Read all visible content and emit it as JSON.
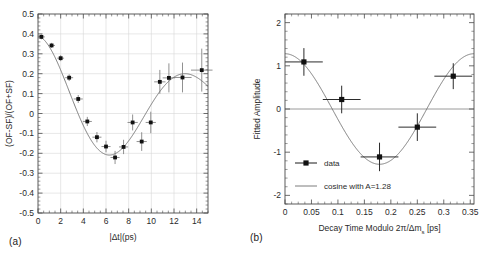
{
  "figure": {
    "panel_a_tag": "(a)",
    "panel_b_tag": "(b)"
  },
  "chart_data": [
    {
      "id": "panel-a",
      "type": "scatter",
      "title": "",
      "xlabel": "|Δt|(ps)",
      "ylabel": "(OF-SF)/(OF+SF)",
      "xlim": [
        0,
        15
      ],
      "ylim": [
        -0.5,
        0.5
      ],
      "grid": true,
      "xticks": [
        0,
        2,
        4,
        6,
        8,
        10,
        12,
        14
      ],
      "xtick_labels": [
        "0",
        "2",
        "4",
        "6",
        "8",
        "10",
        "12",
        "14"
      ],
      "yticks": [
        -0.5,
        -0.4,
        -0.3,
        -0.2,
        -0.1,
        0,
        0.1,
        0.2,
        0.3,
        0.4,
        0.5
      ],
      "ytick_labels": [
        "-0.5",
        "-0.4",
        "-0.3",
        "-0.2",
        "-0.1",
        "0",
        "0.1",
        "0.2",
        "0.3",
        "0.4",
        "0.5"
      ],
      "series": [
        {
          "name": "data",
          "marker": "filled-square",
          "x": [
            0.3,
            1.2,
            2.0,
            2.75,
            3.55,
            4.35,
            5.2,
            6.0,
            6.8,
            7.55,
            8.35,
            9.15,
            9.95,
            10.75,
            11.55,
            12.75,
            14.45
          ],
          "y": [
            0.385,
            0.342,
            0.278,
            0.18,
            0.073,
            -0.04,
            -0.119,
            -0.166,
            -0.221,
            -0.168,
            -0.045,
            -0.141,
            -0.045,
            0.159,
            0.179,
            0.181,
            0.218
          ],
          "xerr": [
            0.3,
            0.3,
            0.3,
            0.35,
            0.4,
            0.4,
            0.4,
            0.4,
            0.4,
            0.4,
            0.45,
            0.45,
            0.45,
            0.5,
            0.55,
            0.8,
            0.95
          ],
          "yerr": [
            0.012,
            0.013,
            0.015,
            0.017,
            0.02,
            0.023,
            0.026,
            0.029,
            0.033,
            0.036,
            0.04,
            0.047,
            0.054,
            0.06,
            0.073,
            0.075,
            0.108
          ]
        }
      ],
      "fit": {
        "name": "fit-curve",
        "description": "damped oscillation fit"
      }
    },
    {
      "id": "panel-b",
      "type": "scatter",
      "title": "",
      "xlabel": "Decay Time Modulo 2π/Δm",
      "xlabel_sub": "s",
      "xlabel_unit": " [ps]",
      "ylabel": "Fitted Amplitude",
      "xlim": [
        0,
        0.3571
      ],
      "ylim": [
        -2.2,
        2.2
      ],
      "grid": false,
      "xticks": [
        0,
        0.05,
        0.1,
        0.15,
        0.2,
        0.25,
        0.3,
        0.35
      ],
      "xtick_labels": [
        "0",
        "0.05",
        "0.1",
        "0.15",
        "0.2",
        "0.25",
        "0.3",
        "0.35"
      ],
      "yticks": [
        -2,
        -1,
        0,
        1,
        2
      ],
      "ytick_labels": [
        "-2",
        "-1",
        "0",
        "1",
        "2"
      ],
      "zero_line": 0,
      "series": [
        {
          "name": "data",
          "marker": "filled-square",
          "x": [
            0.0357,
            0.1071,
            0.1786,
            0.25,
            0.3179
          ],
          "y": [
            1.09,
            0.22,
            -1.11,
            -0.42,
            0.76
          ],
          "xerr": [
            0.0357,
            0.0357,
            0.0357,
            0.0357,
            0.0357
          ],
          "yerr": [
            0.32,
            0.32,
            0.33,
            0.32,
            0.3
          ]
        }
      ],
      "fit": {
        "name": "cosine-fit",
        "amplitude": 1.28,
        "period": 0.3571,
        "label": "cosine with A=1.28"
      },
      "legend": {
        "position": "lower-left",
        "entries": [
          {
            "label": "data",
            "marker": "point-with-errorbar"
          },
          {
            "label": "cosine with A=1.28",
            "marker": "line"
          }
        ]
      }
    }
  ]
}
